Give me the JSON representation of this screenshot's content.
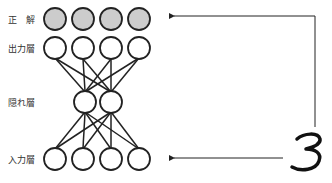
{
  "labels": {
    "correct": "正　解",
    "output": "出力層",
    "hidden": "隠れ層",
    "input": "入力層"
  },
  "annotation": {
    "digit": "3"
  },
  "layers": {
    "correct": {
      "count": 4,
      "fill": "#cccccc"
    },
    "output": {
      "count": 4,
      "fill": "#ffffff"
    },
    "hidden": {
      "count": 2,
      "fill": "#ffffff"
    },
    "input": {
      "count": 4,
      "fill": "#ffffff"
    }
  },
  "colors": {
    "stroke": "#222222",
    "correct_fill": "#cccccc"
  }
}
